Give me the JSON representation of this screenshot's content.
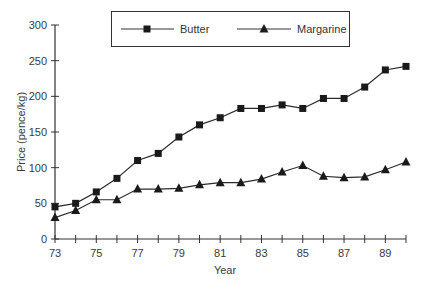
{
  "chart_data": {
    "type": "line",
    "title": "",
    "xlabel": "Year",
    "ylabel": "Price (pence/kg)",
    "x": [
      73,
      74,
      75,
      76,
      77,
      78,
      79,
      80,
      81,
      82,
      83,
      84,
      85,
      86,
      87,
      88,
      89,
      90
    ],
    "x_tick_labels": [
      "73",
      "75",
      "77",
      "79",
      "81",
      "83",
      "85",
      "87",
      "89"
    ],
    "y_tick_labels": [
      "0",
      "50",
      "100",
      "150",
      "200",
      "250",
      "300"
    ],
    "ylim": [
      0,
      300
    ],
    "xlim": [
      73,
      90
    ],
    "grid": false,
    "legend_position": "top-center-boxed",
    "series": [
      {
        "name": "Butter",
        "marker": "square",
        "color": "#1a1a1a",
        "values": [
          45,
          50,
          66,
          85,
          110,
          120,
          143,
          160,
          170,
          183,
          183,
          188,
          183,
          197,
          197,
          213,
          237,
          242
        ]
      },
      {
        "name": "Margarine",
        "marker": "triangle",
        "color": "#1a1a1a",
        "values": [
          30,
          40,
          55,
          55,
          70,
          70,
          71,
          76,
          79,
          79,
          84,
          94,
          103,
          88,
          86,
          87,
          97,
          108
        ]
      }
    ]
  },
  "legend": {
    "items": [
      {
        "label": "Butter",
        "icon": "square-marker-icon"
      },
      {
        "label": "Margarine",
        "icon": "triangle-marker-icon"
      }
    ]
  },
  "axes": {
    "x_title": "Year",
    "y_title": "Price (pence/kg)"
  }
}
